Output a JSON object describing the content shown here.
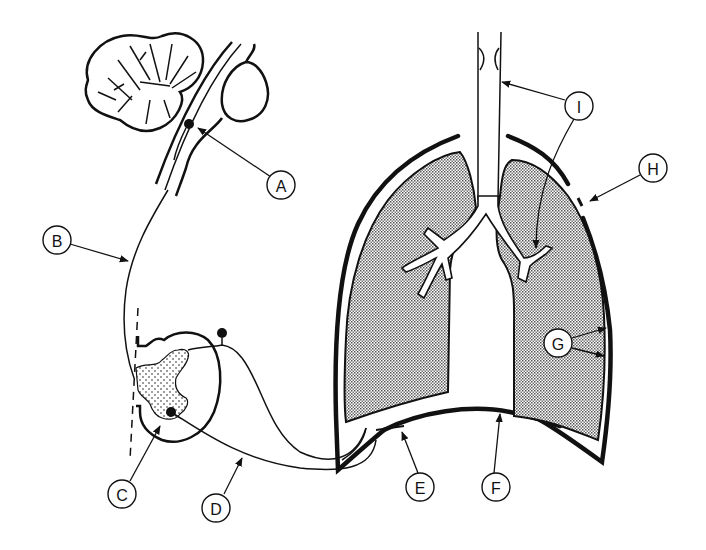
{
  "figure": {
    "type": "anatomical-diagram"
  },
  "labels": [
    {
      "id": "A",
      "text": "A",
      "x": 281,
      "y": 185,
      "points_to": "brainstem respiratory neuron (dot in medulla)"
    },
    {
      "id": "B",
      "text": "B",
      "x": 57,
      "y": 240,
      "points_to": "descending spinal tract"
    },
    {
      "id": "C",
      "text": "C",
      "x": 122,
      "y": 494,
      "points_to": "anterior horn motor neuron in spinal cord"
    },
    {
      "id": "D",
      "text": "D",
      "x": 216,
      "y": 508,
      "points_to": "phrenic nerve"
    },
    {
      "id": "E",
      "text": "E",
      "x": 420,
      "y": 487,
      "points_to": "neuromuscular junction at diaphragm"
    },
    {
      "id": "F",
      "text": "F",
      "x": 496,
      "y": 487,
      "points_to": "diaphragm"
    },
    {
      "id": "G",
      "text": "G",
      "x": 558,
      "y": 343,
      "points_to": "pleura / pleural space"
    },
    {
      "id": "H",
      "text": "H",
      "x": 653,
      "y": 168,
      "points_to": "chest wall"
    },
    {
      "id": "I",
      "text": "I",
      "x": 579,
      "y": 106,
      "points_to": "upper airway and small airways"
    }
  ],
  "colors": {
    "ink": "#111111",
    "background": "#ffffff",
    "lung_fill": "#bdbdbd"
  }
}
